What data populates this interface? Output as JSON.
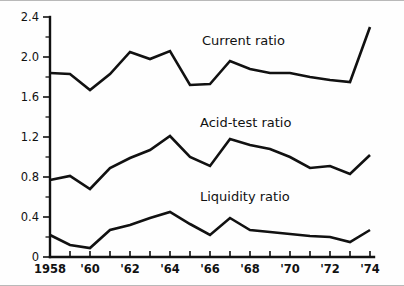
{
  "chart_data": {
    "type": "line",
    "title": "",
    "subtitle": "",
    "xlabel": "",
    "ylabel": "",
    "xlim": [
      1958,
      1974
    ],
    "ylim": [
      0,
      2.4
    ],
    "grid": false,
    "legend_position": "inline-labels",
    "y_ticks_major": [
      "0",
      "0.4",
      "0.8",
      "1.2",
      "1.6",
      "2.0",
      "2.4"
    ],
    "y_tick_values": [
      0,
      0.4,
      0.8,
      1.2,
      1.6,
      2.0,
      2.4
    ],
    "y_minor_step": 0.2,
    "x": [
      1958,
      1959,
      1960,
      1961,
      1962,
      1963,
      1964,
      1965,
      1966,
      1967,
      1968,
      1969,
      1970,
      1971,
      1972,
      1973,
      1974
    ],
    "x_tick_labels": [
      {
        "value": 1958,
        "label": "1958"
      },
      {
        "value": 1959,
        "label": ""
      },
      {
        "value": 1960,
        "label": "'60"
      },
      {
        "value": 1961,
        "label": ""
      },
      {
        "value": 1962,
        "label": "'62"
      },
      {
        "value": 1963,
        "label": ""
      },
      {
        "value": 1964,
        "label": "'64"
      },
      {
        "value": 1965,
        "label": ""
      },
      {
        "value": 1966,
        "label": "'66"
      },
      {
        "value": 1967,
        "label": ""
      },
      {
        "value": 1968,
        "label": "'68"
      },
      {
        "value": 1969,
        "label": ""
      },
      {
        "value": 1970,
        "label": "'70"
      },
      {
        "value": 1971,
        "label": ""
      },
      {
        "value": 1972,
        "label": "'72"
      },
      {
        "value": 1973,
        "label": ""
      },
      {
        "value": 1974,
        "label": "'74"
      }
    ],
    "series": [
      {
        "name": "Current ratio",
        "label": "Current ratio",
        "label_at_x": 1965.6,
        "label_at_y": 2.12,
        "values": [
          1.84,
          1.83,
          1.67,
          1.83,
          2.05,
          1.98,
          2.06,
          1.72,
          1.73,
          1.96,
          1.88,
          1.84,
          1.84,
          1.8,
          1.77,
          1.75,
          2.3
        ]
      },
      {
        "name": "Acid-test ratio",
        "label": "Acid-test ratio",
        "label_at_x": 1965.5,
        "label_at_y": 1.3,
        "values": [
          0.77,
          0.81,
          0.68,
          0.89,
          0.99,
          1.07,
          1.21,
          1.0,
          0.91,
          1.18,
          1.12,
          1.08,
          1.0,
          0.89,
          0.91,
          0.83,
          1.02
        ]
      },
      {
        "name": "Liquidity ratio",
        "label": "Liquidity ratio",
        "label_at_x": 1965.5,
        "label_at_y": 0.56,
        "values": [
          0.22,
          0.12,
          0.09,
          0.27,
          0.32,
          0.39,
          0.45,
          0.33,
          0.22,
          0.39,
          0.27,
          0.25,
          0.23,
          0.21,
          0.2,
          0.15,
          0.27
        ]
      }
    ]
  },
  "colors": {
    "ink": "#111111",
    "background": "#fefefe",
    "frame": "#b9b9b9"
  }
}
